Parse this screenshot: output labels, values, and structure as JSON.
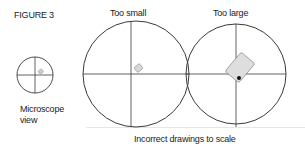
{
  "figure": {
    "label": "FIGURE 3",
    "caption": "Incorrect drawings to scale",
    "panels": [
      {
        "id": "microscope",
        "label_line1": "Microscope",
        "label_line2": "view"
      },
      {
        "id": "too-small",
        "label": "Too small"
      },
      {
        "id": "too-large",
        "label": "Too large"
      }
    ]
  },
  "colors": {
    "line": "#3a3a3a",
    "specimen_fill": "#d8d8d8",
    "specimen_stroke": "#888888",
    "dot": "#111111"
  }
}
